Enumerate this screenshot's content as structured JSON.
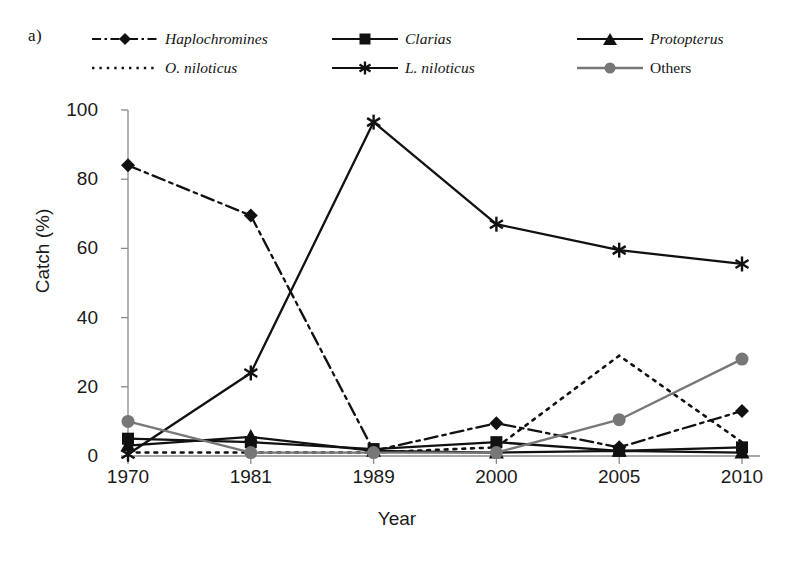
{
  "panel": {
    "label": "a)"
  },
  "legend": {
    "position": "top",
    "items": [
      {
        "name": "Haplochromines",
        "style": "dashdot",
        "marker": "diamond",
        "color": "#111111",
        "italic": true
      },
      {
        "name": "Clarias",
        "style": "solid",
        "marker": "square",
        "color": "#111111",
        "italic": true
      },
      {
        "name": "Protopterus",
        "style": "solid",
        "marker": "triangle",
        "color": "#111111",
        "italic": true
      },
      {
        "name": "O. niloticus",
        "style": "dotted",
        "marker": "none",
        "color": "#111111",
        "italic": true
      },
      {
        "name": "L. niloticus",
        "style": "solid",
        "marker": "asterisk",
        "color": "#111111",
        "italic": true
      },
      {
        "name": "Others",
        "style": "solid",
        "marker": "circle",
        "color": "#777777",
        "italic": false
      }
    ]
  },
  "chart_data": {
    "type": "line",
    "title": "",
    "xlabel": "Year",
    "ylabel": "Catch (%)",
    "categories": [
      "1970",
      "1981",
      "1989",
      "2000",
      "2005",
      "2010"
    ],
    "ylim": [
      0,
      100
    ],
    "yticks": [
      "0",
      "20",
      "40",
      "60",
      "80",
      "100"
    ],
    "grid": false,
    "series": [
      {
        "name": "Haplochromines",
        "values": [
          84,
          69.5,
          1.5,
          9.5,
          2.5,
          13
        ]
      },
      {
        "name": "Clarias",
        "values": [
          5,
          4,
          2,
          4,
          1.5,
          2.5
        ]
      },
      {
        "name": "Protopterus",
        "values": [
          3,
          5.5,
          1.5,
          1,
          1.5,
          1
        ]
      },
      {
        "name": "O. niloticus",
        "values": [
          1,
          1,
          1,
          2.5,
          29,
          4
        ]
      },
      {
        "name": "L. niloticus",
        "values": [
          0.5,
          24,
          96.5,
          67,
          59.5,
          55.5
        ]
      },
      {
        "name": "Others",
        "values": [
          10,
          1,
          1,
          1,
          10.5,
          28
        ]
      }
    ]
  }
}
